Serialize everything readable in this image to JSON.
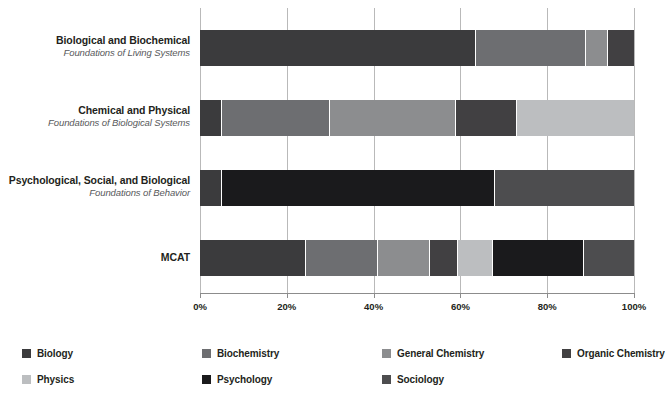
{
  "chart_data": {
    "type": "bar",
    "orientation": "horizontal",
    "stacked": true,
    "normalized": true,
    "title": "",
    "xlabel": "",
    "ylabel": "",
    "xlim": [
      0,
      100
    ],
    "xticks": [
      "0%",
      "20%",
      "40%",
      "60%",
      "80%",
      "100%"
    ],
    "xtick_values": [
      0,
      20,
      40,
      60,
      80,
      100
    ],
    "grid": true,
    "legend_position": "bottom-left",
    "categories": [
      {
        "title": "Biological and Biochemical",
        "subtitle": "Foundations of Living Systems"
      },
      {
        "title": "Chemical and Physical",
        "subtitle": "Foundations of Biological Systems"
      },
      {
        "title": "Psychological, Social, and Biological",
        "subtitle": "Foundations of Behavior"
      },
      {
        "title": "MCAT",
        "subtitle": ""
      }
    ],
    "series": [
      {
        "name": "Biology",
        "color": "#3b3b3d",
        "values": [
          63.5,
          5.0,
          5.0,
          24.5
        ]
      },
      {
        "name": "Biochemistry",
        "color": "#6d6e71",
        "values": [
          25.5,
          25.0,
          0.0,
          16.5
        ]
      },
      {
        "name": "General Chemistry",
        "color": "#8c8d8f",
        "values": [
          5.0,
          29.0,
          0.0,
          12.0
        ]
      },
      {
        "name": "Organic Chemistry",
        "color": "#414042",
        "values": [
          6.0,
          14.0,
          0.0,
          6.5
        ]
      },
      {
        "name": "Physics",
        "color": "#bcbec0",
        "values": [
          0.0,
          27.0,
          0.0,
          8.0
        ]
      },
      {
        "name": "Psychology",
        "color": "#1a1a1c",
        "values": [
          0.0,
          0.0,
          63.0,
          21.0
        ]
      },
      {
        "name": "Sociology",
        "color": "#4d4d4f",
        "values": [
          0.0,
          0.0,
          32.0,
          11.5
        ]
      }
    ],
    "legend_entries": [
      {
        "label": "Biology",
        "color": "#3b3b3d"
      },
      {
        "label": "Biochemistry",
        "color": "#6d6e71"
      },
      {
        "label": "General Chemistry",
        "color": "#8c8d8f"
      },
      {
        "label": "Organic Chemistry",
        "color": "#414042"
      },
      {
        "label": "Physics",
        "color": "#bcbec0"
      },
      {
        "label": "Psychology",
        "color": "#1a1a1c"
      },
      {
        "label": "Sociology",
        "color": "#4d4d4f"
      }
    ],
    "axis_color": "#8c8c8c",
    "grid_color": "#b9b9b9",
    "text_color": "#231f20",
    "subtitle_color": "#58595b",
    "background": "#ffffff"
  }
}
